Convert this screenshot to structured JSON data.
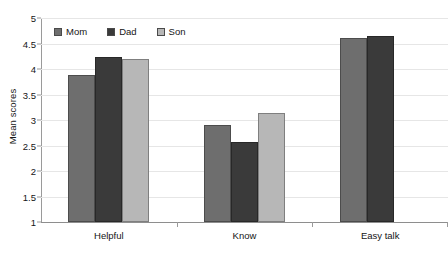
{
  "chart_data": {
    "type": "bar",
    "title": "",
    "subtitle": "",
    "xlabel": "",
    "ylabel": "Mean scores",
    "ylim": [
      1,
      5
    ],
    "ytick_step": 0.5,
    "yticks": [
      "5",
      "4.5",
      "4",
      "3.5",
      "3",
      "2.5",
      "2",
      "1.5",
      "1"
    ],
    "ytick_values": [
      5,
      4.5,
      4,
      3.5,
      3,
      2.5,
      2,
      1.5,
      1
    ],
    "grid": true,
    "grid_axis": "y",
    "legend_position": "top-left-inside",
    "categories": [
      "Helpful",
      "Know",
      "Easy talk"
    ],
    "series": [
      {
        "name": "Mom",
        "color": "#6e6e6e",
        "values": [
          3.88,
          2.9,
          4.6
        ]
      },
      {
        "name": "Dad",
        "color": "#3a3a3a",
        "values": [
          4.23,
          2.57,
          4.65
        ]
      },
      {
        "name": "Son",
        "color": "#b7b7b7",
        "values": [
          4.19,
          3.13,
          null
        ]
      }
    ]
  },
  "axis": {
    "y_label_text": "Mean scores"
  },
  "legend": {
    "items": [
      {
        "label": "Mom",
        "swatch_color": "#6e6e6e"
      },
      {
        "label": "Dad",
        "swatch_color": "#3a3a3a"
      },
      {
        "label": "Son",
        "swatch_color": "#b7b7b7"
      }
    ]
  },
  "colors": {
    "background": "#ffffff",
    "gridline": "#e6e6e6",
    "axis": "#9a9a9a",
    "text": "#151515"
  }
}
